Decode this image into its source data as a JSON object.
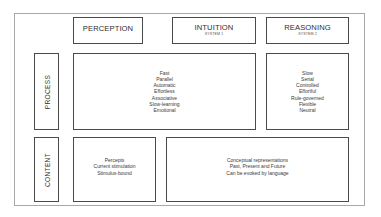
{
  "columns": {
    "perception": {
      "title": "PERCEPTION"
    },
    "intuition": {
      "title": "INTUITION",
      "subtitle": "SYSTEM 1"
    },
    "reasoning": {
      "title": "REASONING",
      "subtitle": "SYSTEM 2"
    }
  },
  "rows": {
    "process": {
      "label": "PROCESS"
    },
    "content": {
      "label": "CONTENT"
    }
  },
  "process": {
    "perception_intuition": [
      "Fast",
      "Parallel",
      "Automatic",
      "Effortless",
      "Associative",
      "Slow-learning",
      "Emotional"
    ],
    "reasoning": [
      "Slow",
      "Serial",
      "Controlled",
      "Effortful",
      "Rule-governed",
      "Flexible",
      "Neutral"
    ]
  },
  "content": {
    "perception": [
      "Percepts",
      "Current stimulation",
      "Stimulus-bound"
    ],
    "intuition_reasoning": [
      "Conceptual representations",
      "Past, Present and Future",
      "Can be evoked by language"
    ]
  },
  "colors": {
    "border": "#4a4a4a",
    "frame": "#a8a8a8",
    "text": "#333333"
  }
}
